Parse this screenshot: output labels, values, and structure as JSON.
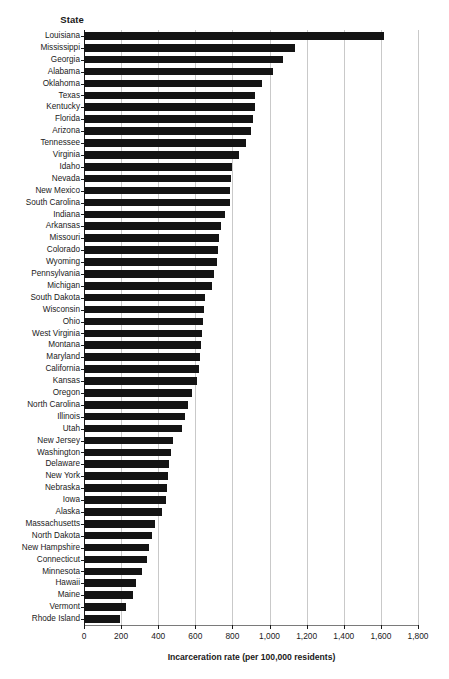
{
  "chart_data": {
    "type": "bar",
    "orientation": "horizontal",
    "title": "",
    "xlabel": "Incarceration rate (per 100,000 residents)",
    "ylabel": "State",
    "xlim": [
      0,
      1800
    ],
    "xticks": [
      0,
      200,
      400,
      600,
      800,
      1000,
      1200,
      1400,
      1600,
      1800
    ],
    "xtick_labels": [
      "0",
      "200",
      "400",
      "600",
      "800",
      "1,000",
      "1,200",
      "1,400",
      "1,600",
      "1,800"
    ],
    "grid": true,
    "grid_axis": "x",
    "legend": null,
    "bar_color": "#141414",
    "sorted": "descending",
    "categories": [
      "Louisiana",
      "Mississippi",
      "Georgia",
      "Alabama",
      "Oklahoma",
      "Texas",
      "Kentucky",
      "Florida",
      "Arizona",
      "Tennessee",
      "Virginia",
      "Idaho",
      "Nevada",
      "New Mexico",
      "South Carolina",
      "Indiana",
      "Arkansas",
      "Missouri",
      "Colorado",
      "Wyoming",
      "Pennsylvania",
      "Michigan",
      "South Dakota",
      "Wisconsin",
      "Ohio",
      "West Virginia",
      "Montana",
      "Maryland",
      "California",
      "Kansas",
      "Oregon",
      "North Carolina",
      "Illinois",
      "Utah",
      "New Jersey",
      "Washington",
      "Delaware",
      "New York",
      "Nebraska",
      "Iowa",
      "Alaska",
      "Massachusetts",
      "North Dakota",
      "New Hampshire",
      "Connecticut",
      "Minnesota",
      "Hawaii",
      "Maine",
      "Vermont",
      "Rhode Island"
    ],
    "values": [
      1619,
      1135,
      1071,
      1018,
      959,
      924,
      921,
      913,
      900,
      871,
      835,
      795,
      792,
      788,
      785,
      760,
      740,
      730,
      720,
      718,
      700,
      690,
      650,
      645,
      640,
      635,
      630,
      625,
      620,
      610,
      580,
      560,
      545,
      530,
      480,
      470,
      460,
      450,
      445,
      440,
      420,
      380,
      365,
      350,
      340,
      310,
      280,
      265,
      225,
      195
    ]
  },
  "axis": {
    "ylabel": "State",
    "xlabel": "Incarceration rate (per 100,000 residents)"
  }
}
